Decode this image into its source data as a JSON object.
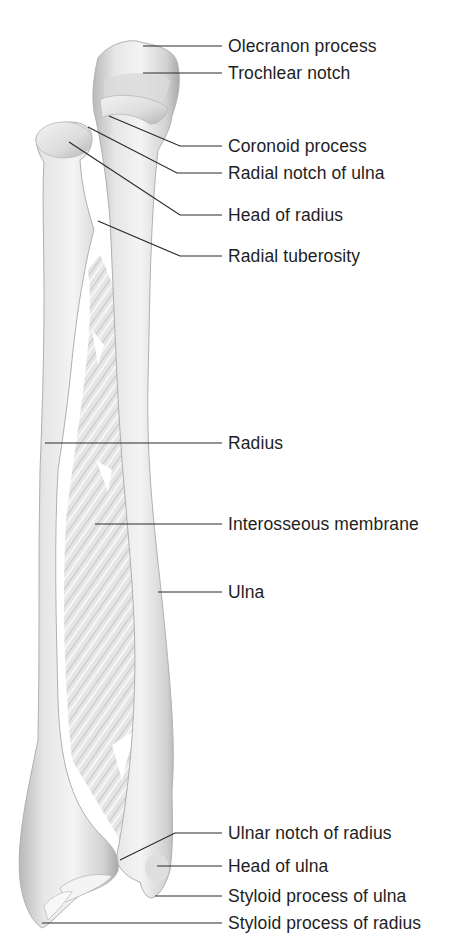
{
  "figure": {
    "colors": {
      "bone_light": "#f2f2f2",
      "bone_mid": "#d6d6d6",
      "bone_dark": "#a8a8a8",
      "leader_line": "#2a2a2a",
      "text": "#1e1e1e"
    },
    "labels": [
      {
        "id": "olecranon",
        "text": "Olecranon process",
        "y": 36
      },
      {
        "id": "trochlear",
        "text": "Trochlear notch",
        "y": 63
      },
      {
        "id": "coronoid",
        "text": "Coronoid process",
        "y": 136
      },
      {
        "id": "radial-notch",
        "text": "Radial notch of ulna",
        "y": 163
      },
      {
        "id": "head-radius",
        "text": "Head of radius",
        "y": 205
      },
      {
        "id": "radial-tuberosity",
        "text": "Radial tuberosity",
        "y": 246
      },
      {
        "id": "radius",
        "text": "Radius",
        "y": 436
      },
      {
        "id": "interosseous",
        "text": "Interosseous membrane",
        "y": 515
      },
      {
        "id": "ulna",
        "text": "Ulna",
        "y": 583
      },
      {
        "id": "ulnar-notch",
        "text": "Ulnar notch of radius",
        "y": 823
      },
      {
        "id": "head-ulna",
        "text": "Head of ulna",
        "y": 856
      },
      {
        "id": "styloid-ulna",
        "text": "Styloid process of ulna",
        "y": 886
      },
      {
        "id": "styloid-radius",
        "text": "Styloid process of radius",
        "y": 913
      }
    ]
  }
}
